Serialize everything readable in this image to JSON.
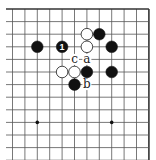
{
  "diagram": {
    "type": "go-board-fragment",
    "corner_shown": "top-right",
    "grid": {
      "columns": 12,
      "rows": 13,
      "origin_x": 12.5,
      "origin_y": 9,
      "spacing_x": 12.4,
      "spacing_y": 12.6,
      "line_color": "#555555",
      "edge_color": "#333333"
    },
    "hoshi": [
      {
        "col": 2,
        "row": 9
      },
      {
        "col": 8,
        "row": 9
      }
    ],
    "stones": [
      {
        "color": "white",
        "col": 6,
        "row": 2
      },
      {
        "color": "black",
        "col": 7,
        "row": 2
      },
      {
        "color": "white",
        "col": 6,
        "row": 3
      },
      {
        "color": "black",
        "col": 2,
        "row": 3
      },
      {
        "color": "black",
        "col": 4,
        "row": 3,
        "number": "1"
      },
      {
        "color": "black",
        "col": 8,
        "row": 3
      },
      {
        "color": "white",
        "col": 4,
        "row": 5
      },
      {
        "color": "white",
        "col": 5,
        "row": 5
      },
      {
        "color": "black",
        "col": 6,
        "row": 5
      },
      {
        "color": "black",
        "col": 8,
        "row": 5
      },
      {
        "color": "black",
        "col": 5,
        "row": 6
      }
    ],
    "labels": [
      {
        "text": "c",
        "col": 5,
        "row": 4
      },
      {
        "text": "a",
        "col": 6,
        "row": 4
      },
      {
        "text": "b",
        "col": 6,
        "row": 6
      }
    ],
    "colors": {
      "black_stone": "#111111",
      "white_stone": "#ffffff",
      "white_stone_border": "#333333",
      "background": "#ffffff"
    }
  }
}
